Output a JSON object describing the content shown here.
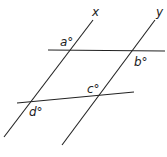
{
  "diagram": {
    "type": "parallel-lines-with-transversals",
    "lines": [
      {
        "id": "x",
        "label": "x",
        "x1": 93,
        "y1": 20,
        "x2": 4,
        "y2": 137,
        "label_x": 92,
        "label_y": 16
      },
      {
        "id": "y",
        "label": "y",
        "x1": 155,
        "y1": 20,
        "x2": 62,
        "y2": 145,
        "label_x": 156,
        "label_y": 16
      },
      {
        "id": "transversal-top",
        "x1": 48,
        "y1": 50,
        "x2": 165,
        "y2": 51
      },
      {
        "id": "transversal-bottom",
        "x1": 17,
        "y1": 103,
        "x2": 134,
        "y2": 92
      }
    ],
    "angles": [
      {
        "id": "a",
        "label": "a°",
        "x": 60,
        "y": 46
      },
      {
        "id": "b",
        "label": "b°",
        "x": 134,
        "y": 66
      },
      {
        "id": "c",
        "label": "c°",
        "x": 87,
        "y": 93
      },
      {
        "id": "d",
        "label": "d°",
        "x": 29,
        "y": 116
      }
    ],
    "colors": {
      "stroke": "#222222",
      "background": "#ffffff"
    }
  }
}
